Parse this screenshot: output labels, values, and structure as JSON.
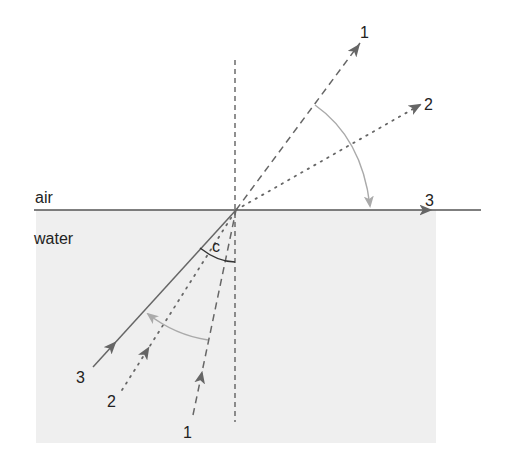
{
  "diagram": {
    "media": {
      "upper": "air",
      "lower": "water"
    },
    "angle_label": "c",
    "rays": [
      {
        "id": "1",
        "label_in": "1",
        "label_out": "1",
        "style": "dashed"
      },
      {
        "id": "2",
        "label_in": "2",
        "label_out": "2",
        "style": "dotted"
      },
      {
        "id": "3",
        "label_in": "3",
        "label_out": "3",
        "style": "solid"
      }
    ],
    "colors": {
      "water": "#efefef",
      "surface": "#555555",
      "ray": "#666666",
      "arc": "#aaaaaa",
      "normal": "#555555",
      "text": "#222222"
    }
  }
}
